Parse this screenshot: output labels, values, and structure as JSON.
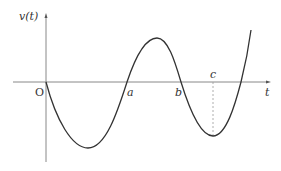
{
  "figure": {
    "y_axis_label": "v(t)",
    "x_axis_label": "t",
    "origin_label": "O",
    "points": {
      "a": "a",
      "b": "b",
      "c": "c"
    },
    "colors": {
      "axis": "#888888",
      "curve": "#333333",
      "dashed": "#999999"
    }
  }
}
